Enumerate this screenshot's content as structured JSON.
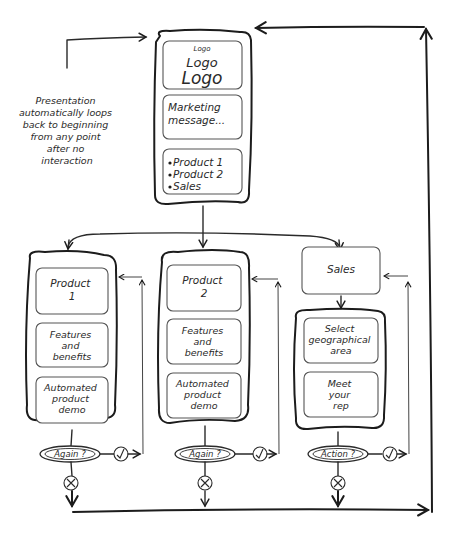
{
  "diagram": {
    "type": "flowchart",
    "note": {
      "lines": [
        "Presentation",
        "automatically loops",
        "back to beginning",
        "from any point",
        "after no",
        "interaction"
      ]
    },
    "home": {
      "logo_small": "Logo",
      "logo_medium": "Logo",
      "logo_large": "Logo",
      "marketing": [
        "Marketing",
        "message..."
      ],
      "menu_items": [
        "Product 1",
        "Product 2",
        "Sales"
      ]
    },
    "columns": [
      {
        "id": "product-1",
        "title": [
          "Product",
          "1"
        ],
        "panels": [
          [
            "Features",
            "and",
            "benefits"
          ],
          [
            "Automated",
            "product",
            "demo"
          ]
        ],
        "decision": "Again ?",
        "yes_icon": "check-icon",
        "no_icon": "cross-icon"
      },
      {
        "id": "product-2",
        "title": [
          "Product",
          "2"
        ],
        "panels": [
          [
            "Features",
            "and",
            "benefits"
          ],
          [
            "Automated",
            "product",
            "demo"
          ]
        ],
        "decision": "Again ?",
        "yes_icon": "check-icon",
        "no_icon": "cross-icon"
      },
      {
        "id": "sales",
        "title": [
          "Sales"
        ],
        "panels": [
          [
            "Select",
            "geographical",
            "area"
          ],
          [
            "Meet",
            "your",
            "rep"
          ]
        ],
        "decision": "Action ?",
        "yes_icon": "check-icon",
        "no_icon": "cross-icon"
      }
    ],
    "colors": {
      "line": "#1c1c1c",
      "text": "#2a2a2a",
      "inner_border": "#555555",
      "background": "#ffffff"
    }
  }
}
